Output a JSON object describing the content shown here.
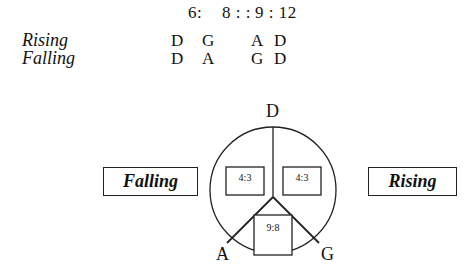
{
  "table": {
    "header": [
      "6:",
      "8 : :",
      "9 : 12"
    ],
    "rows": [
      {
        "label": "Rising",
        "values": [
          "D",
          "G",
          "A",
          "D"
        ]
      },
      {
        "label": "Falling",
        "values": [
          "D",
          "A",
          "G",
          "D"
        ]
      }
    ]
  },
  "diagram": {
    "vertices": {
      "top": "D",
      "left": "A",
      "right": "G"
    },
    "sectors": {
      "upper_left": "4:3",
      "upper_right": "4:3",
      "bottom": "9:8"
    },
    "left_box": "Falling",
    "right_box": "Rising"
  }
}
